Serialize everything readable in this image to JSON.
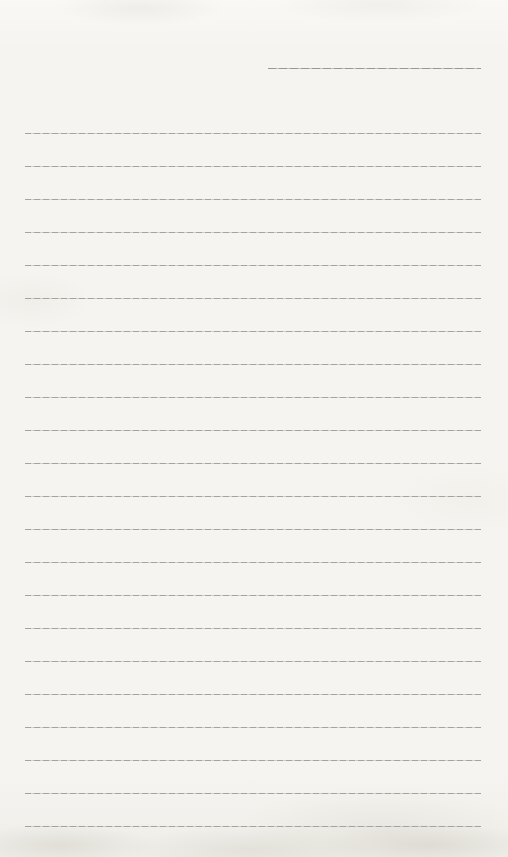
{
  "page": {
    "background_color": "#f5f4f0",
    "line_color": "#a4a39e",
    "title_line_color": "#989794",
    "title_line": {
      "x": 268,
      "y": 68,
      "width": 213
    },
    "ruled_lines": {
      "count": 22,
      "first_y": 133,
      "spacing": 33,
      "x_start": 25,
      "x_end": 481
    }
  }
}
